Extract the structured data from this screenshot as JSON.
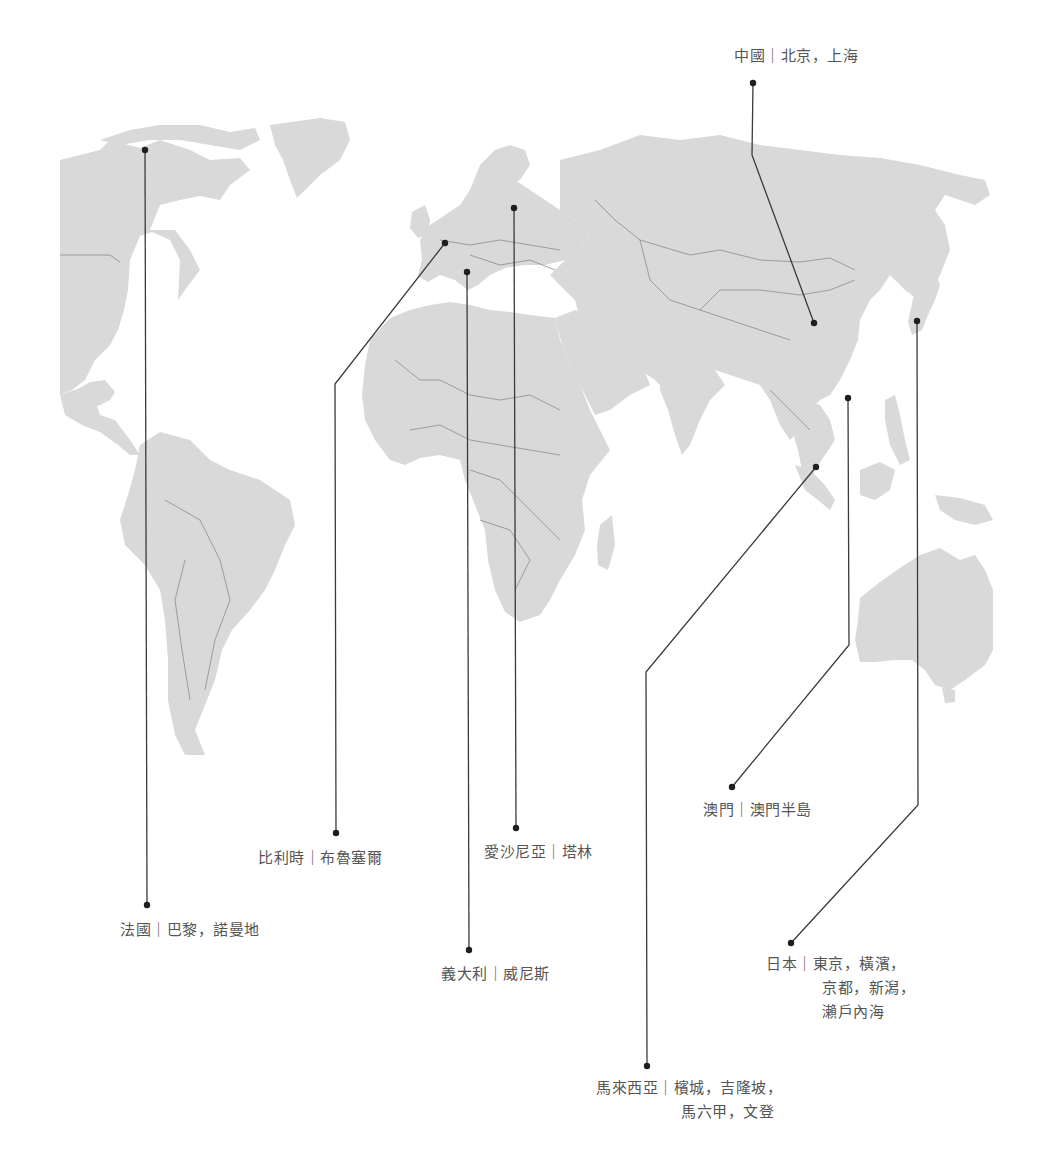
{
  "map": {
    "type": "world-map",
    "land_color": "#d9d9d9",
    "border_color": "#8c8c8c",
    "leader_color": "#3a3a3a",
    "label_color": "#555555"
  },
  "locations": [
    {
      "id": "china",
      "country": "中國",
      "separator": "｜",
      "lines": [
        "北京，上海"
      ],
      "dot": [
        814,
        323
      ],
      "label_dot": [
        753,
        83
      ]
    },
    {
      "id": "france",
      "country": "法國",
      "separator": "｜",
      "lines": [
        "巴黎，諾曼地"
      ],
      "dot": [
        145,
        150
      ],
      "label_dot": [
        147,
        905
      ]
    },
    {
      "id": "belgium",
      "country": "比利時",
      "separator": "｜",
      "lines": [
        "布魯塞爾"
      ],
      "dot": [
        445,
        243
      ],
      "label_dot": [
        336,
        833
      ]
    },
    {
      "id": "estonia",
      "country": "愛沙尼亞",
      "separator": "｜",
      "lines": [
        "塔林"
      ],
      "dot": [
        514,
        208
      ],
      "label_dot": [
        516,
        828
      ]
    },
    {
      "id": "italy",
      "country": "義大利",
      "separator": "｜",
      "lines": [
        "威尼斯"
      ],
      "dot": [
        467,
        272
      ],
      "label_dot": [
        469,
        950
      ]
    },
    {
      "id": "macau",
      "country": "澳門",
      "separator": "｜",
      "lines": [
        "澳門半島"
      ],
      "dot": [
        848,
        398
      ],
      "label_dot": [
        732,
        787
      ]
    },
    {
      "id": "japan",
      "country": "日本",
      "separator": "｜",
      "lines": [
        "東京，橫濱，",
        "京都，新潟，",
        "瀨戶內海"
      ],
      "dot": [
        917,
        321
      ],
      "label_dot": [
        791,
        943
      ]
    },
    {
      "id": "malaysia",
      "country": "馬來西亞",
      "separator": "｜",
      "lines": [
        "檳城，吉隆坡，",
        "馬六甲，文登"
      ],
      "dot": [
        816,
        467
      ],
      "label_dot": [
        647,
        1066
      ]
    }
  ]
}
